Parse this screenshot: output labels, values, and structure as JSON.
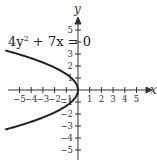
{
  "chart_data": {
    "type": "line",
    "title": "",
    "equation": "4y^2 + 7x = 0",
    "equation_parts": {
      "pre": "4y",
      "exp": "2",
      "post": " + 7x = 0"
    },
    "xlabel": "x",
    "ylabel": "y",
    "xlim": [
      -6,
      6
    ],
    "ylim": [
      -6,
      6
    ],
    "x_ticks": [
      -5,
      -4,
      -3,
      -2,
      -1,
      1,
      2,
      3,
      4,
      5
    ],
    "y_ticks": [
      5,
      4,
      3,
      2,
      1,
      -1,
      -2,
      -3,
      -4,
      -5
    ],
    "y_tick_labels_shown": [
      5,
      3,
      2,
      1,
      -1,
      -2,
      -3,
      -4,
      -5
    ],
    "series": [
      {
        "name": "4y^2 + 7x = 0",
        "description": "parabola opening left, vertex at origin, x = -4y^2/7",
        "x": [
          -6.0,
          -4.57,
          -2.57,
          -1.14,
          -0.29,
          0,
          -0.29,
          -1.14,
          -2.57,
          -4.57,
          -6.0
        ],
        "y": [
          3.24,
          2.83,
          2.12,
          1.41,
          0.71,
          0,
          -0.71,
          -1.41,
          -2.12,
          -2.83,
          -3.24
        ]
      }
    ],
    "colors": {
      "curve": "#222222",
      "axes": "#333333"
    },
    "grid": false
  }
}
